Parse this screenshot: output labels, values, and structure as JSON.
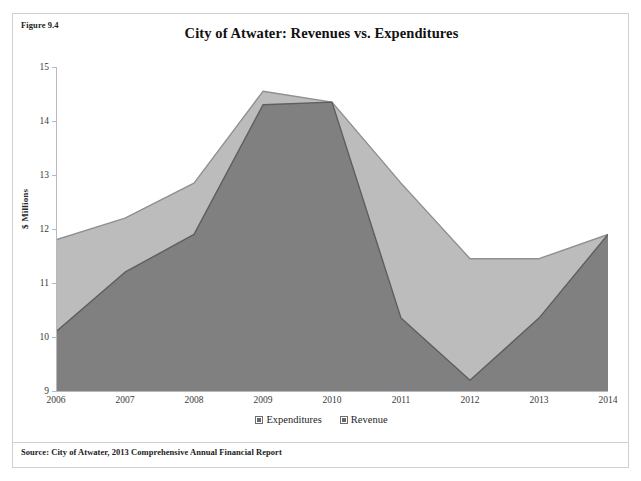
{
  "page": {
    "figure_number": "Figure 9.4",
    "ghost_scan_text": "",
    "source_note": "Source: City of Atwater, 2013 Comprehensive Annual Financial Report"
  },
  "colors": {
    "revenue_fill": "#bcbcbc",
    "expenditures_fill": "#808080",
    "revenue_stroke": "#8f8f8f",
    "expenditures_stroke": "#5e5e5e",
    "axis": "#b9b9bd",
    "panel_border": "#cfcfd4",
    "text": "#1b1b1b"
  },
  "legend": {
    "position": "bottom-center",
    "items": [
      {
        "label": "Expenditures",
        "color": "#808080"
      },
      {
        "label": "Revenue",
        "color": "#bcbcbc"
      }
    ]
  },
  "chart_data": {
    "type": "area",
    "title": "City of Atwater: Revenues vs. Expenditures",
    "xlabel": "",
    "ylabel": "$ Millions",
    "categories": [
      "2006",
      "2007",
      "2008",
      "2009",
      "2010",
      "2011",
      "2012",
      "2013",
      "2014"
    ],
    "x_tick_labels": [
      "2006",
      "2007",
      "2008",
      "2009",
      "2010",
      "2011",
      "2012",
      "2013",
      "2014"
    ],
    "y_tick_labels": [
      "9",
      "10",
      "11",
      "12",
      "13",
      "14",
      "15"
    ],
    "ylim": [
      9,
      15
    ],
    "y_tick_step": 1,
    "grid": false,
    "series": [
      {
        "name": "Expenditures",
        "color": "#808080",
        "values": [
          10.1,
          11.2,
          11.9,
          14.3,
          14.35,
          10.35,
          9.2,
          10.35,
          11.9
        ]
      },
      {
        "name": "Revenue",
        "color": "#bcbcbc",
        "values": [
          11.8,
          12.2,
          12.85,
          14.55,
          14.35,
          12.85,
          11.45,
          11.45,
          11.9
        ]
      }
    ],
    "annotations": []
  }
}
